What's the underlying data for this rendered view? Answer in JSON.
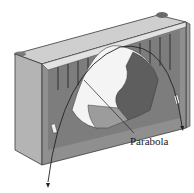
{
  "figure": {
    "labels": [
      {
        "id": "parabola",
        "text": "Parabola"
      }
    ],
    "colors": {
      "background": "#ffffff",
      "top_face": "#c9c9c9",
      "side_face": "#a9a9a9",
      "front_face": "#8e8e8e",
      "inner_shadow": "#6a6a6a",
      "opening": "#f4f4f4",
      "curve": "#2a2a2a"
    }
  }
}
